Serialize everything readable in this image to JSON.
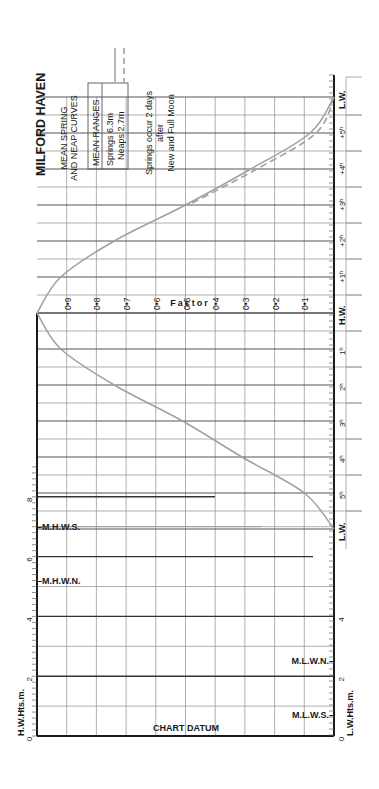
{
  "title": "MILFORD HAVEN",
  "subtitle_lines": [
    "MEAN SPRING",
    "AND NEAP CURVES"
  ],
  "mean_ranges": {
    "header": "MEAN RANGES",
    "rows": [
      {
        "label": "Springs",
        "value": "6.3m",
        "line_style": "solid"
      },
      {
        "label": "Neaps",
        "value": "2.7m",
        "line_style": "dashed"
      }
    ]
  },
  "note_lines": [
    "Springs occur 2 days",
    "after",
    "New and Full Moon"
  ],
  "factor_label": "Factor",
  "factor_ticks": [
    "0•9",
    "0•8",
    "0•7",
    "0•6",
    "0•5",
    "0•4",
    "0•3",
    "0•2",
    "0•1"
  ],
  "rising_hour_labels": [
    "L.W.",
    "+5h",
    "+4h",
    "+3h",
    "+2h",
    "+1h",
    "H.W."
  ],
  "falling_hour_labels": [
    "1h",
    "2h",
    "3h",
    "4h",
    "5h",
    "L.W."
  ],
  "hw_axis": {
    "label": "H.W.Hts.m.",
    "ticks": [
      "0",
      "2",
      "4",
      "6",
      "8"
    ]
  },
  "lw_axis": {
    "label": "L.W.Hts.m.",
    "ticks": [
      "0",
      "2",
      "4"
    ]
  },
  "levels": {
    "mhws": "M.H.W.S.",
    "mhwn": "M.H.W.N.",
    "mlwn": "M.L.W.N.",
    "mlws": "M.L.W.S.",
    "datum": "CHART DATUM"
  },
  "colors": {
    "curve": "#a0a0a0",
    "grid": "#9a9a9a",
    "axis": "#1a1a1a",
    "text": "#1a1a1a"
  },
  "chart_data": {
    "type": "line",
    "x_label": "Hours relative to H.W.",
    "y_label": "Factor",
    "x": [
      -6,
      -5,
      -4,
      -3,
      -2,
      -1,
      0,
      1,
      2,
      3,
      4,
      5,
      6
    ],
    "series": [
      {
        "name": "Springs (6.3m)",
        "style": "solid",
        "values": [
          0.0,
          0.08,
          0.28,
          0.5,
          0.74,
          0.92,
          1.0,
          0.92,
          0.74,
          0.51,
          0.31,
          0.1,
          0.0
        ]
      },
      {
        "name": "Neaps (2.7m)",
        "style": "dashed",
        "values": [
          0.0,
          0.06,
          0.26,
          0.49,
          0.74,
          0.92,
          1.0,
          0.92,
          0.74,
          0.52,
          0.33,
          0.13,
          0.0
        ]
      }
    ],
    "height_axis_hw": {
      "label": "H.W.Hts.m.",
      "range": [
        0,
        8
      ]
    },
    "height_axis_lw": {
      "label": "L.W.Hts.m.",
      "range": [
        0,
        4
      ]
    },
    "levels_m": {
      "M.H.W.S.": 7.0,
      "M.H.W.N.": 5.2,
      "M.L.W.N.": 2.5,
      "M.L.W.S.": 0.7
    }
  }
}
